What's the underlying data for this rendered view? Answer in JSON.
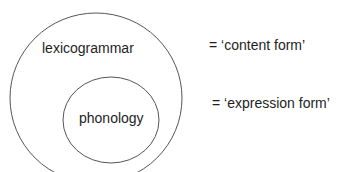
{
  "diagram": {
    "outer": {
      "label": "lexicogrammar",
      "gloss": "= ‘content form’"
    },
    "inner": {
      "label": "phonology",
      "gloss": "= ‘expression form’"
    },
    "stroke_color": "#555555"
  }
}
